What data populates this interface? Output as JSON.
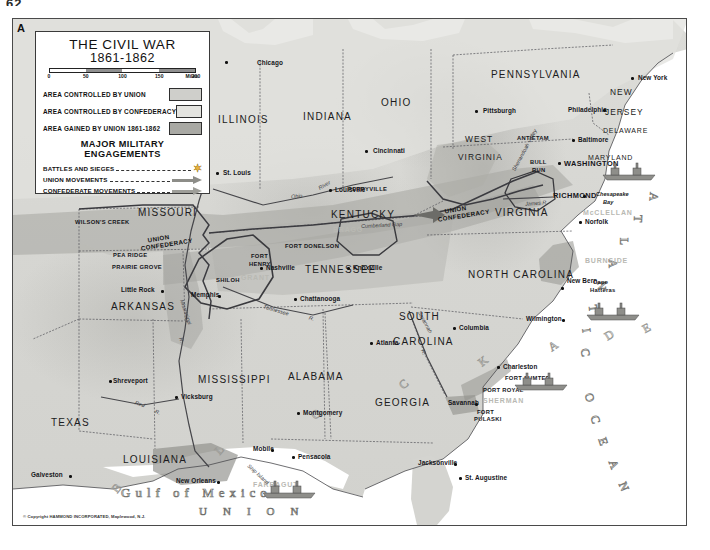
{
  "page": {
    "number": "62",
    "corner_label": "A"
  },
  "legend": {
    "title": "THE CIVIL WAR",
    "subtitle": "1861-1862",
    "scale": {
      "ticks": [
        "0",
        "50",
        "100",
        "150",
        "200"
      ],
      "unit": "Miles"
    },
    "area_rows": [
      {
        "label": "AREA CONTROLLED BY UNION",
        "swatch": "union",
        "color": "#cfcfcb"
      },
      {
        "label": "AREA CONTROLLED BY CONFEDERACY",
        "swatch": "confed",
        "color": "#e4e4e0"
      },
      {
        "label": "AREA GAINED BY UNION 1861-1862",
        "swatch": "gained",
        "color": "#a9a9a4"
      }
    ],
    "engagements_title": "MAJOR MILITARY ENGAGEMENTS",
    "engagement_rows": [
      {
        "label": "BATTLES AND SIEGES",
        "symbol": "star-icon"
      },
      {
        "label": "UNION MOVEMENTS",
        "symbol": "union-arrow-icon"
      },
      {
        "label": "CONFEDERATE MOVEMENTS",
        "symbol": "confederate-arrow-icon"
      }
    ]
  },
  "copyright": "© Copyright HAMMOND INCORPORATED, Maplewood, N.J.",
  "states": [
    {
      "name": "ILLINOIS",
      "x": 205,
      "y": 95,
      "size": "state"
    },
    {
      "name": "INDIANA",
      "x": 290,
      "y": 92,
      "size": "state"
    },
    {
      "name": "OHIO",
      "x": 368,
      "y": 78,
      "size": "state"
    },
    {
      "name": "PENNSYLVANIA",
      "x": 478,
      "y": 50,
      "size": "state"
    },
    {
      "name": "NEW",
      "x": 597,
      "y": 68,
      "size": "state sm"
    },
    {
      "name": "JERSEY",
      "x": 592,
      "y": 88,
      "size": "state sm"
    },
    {
      "name": "DELAWARE",
      "x": 590,
      "y": 108,
      "size": "state xs"
    },
    {
      "name": "MARYLAND",
      "x": 575,
      "y": 135,
      "size": "state xs"
    },
    {
      "name": "WEST",
      "x": 452,
      "y": 115,
      "size": "state sm"
    },
    {
      "name": "VIRGINIA",
      "x": 445,
      "y": 133,
      "size": "state sm"
    },
    {
      "name": "VIRGINIA",
      "x": 482,
      "y": 188,
      "size": "state"
    },
    {
      "name": "MISSOURI",
      "x": 125,
      "y": 188,
      "size": "state"
    },
    {
      "name": "KENTUCKY",
      "x": 318,
      "y": 190,
      "size": "state"
    },
    {
      "name": "TENNESSEE",
      "x": 292,
      "y": 245,
      "size": "state"
    },
    {
      "name": "NORTH CAROLINA",
      "x": 455,
      "y": 250,
      "size": "state"
    },
    {
      "name": "ARKANSAS",
      "x": 98,
      "y": 282,
      "size": "state"
    },
    {
      "name": "SOUTH",
      "x": 386,
      "y": 292,
      "size": "state"
    },
    {
      "name": "CAROLINA",
      "x": 380,
      "y": 317,
      "size": "state"
    },
    {
      "name": "MISSISSIPPI",
      "x": 185,
      "y": 355,
      "size": "state"
    },
    {
      "name": "ALABAMA",
      "x": 275,
      "y": 352,
      "size": "state"
    },
    {
      "name": "GEORGIA",
      "x": 362,
      "y": 378,
      "size": "state"
    },
    {
      "name": "TEXAS",
      "x": 38,
      "y": 398,
      "size": "state"
    },
    {
      "name": "LOUISIANA",
      "x": 110,
      "y": 435,
      "size": "state"
    }
  ],
  "cities": [
    {
      "name": "Chicago",
      "x": 244,
      "y": 40,
      "dx": 212,
      "dy": 42
    },
    {
      "name": "St. Louis",
      "x": 210,
      "y": 150,
      "dx": 203,
      "dy": 153
    },
    {
      "name": "Cincinnati",
      "x": 360,
      "y": 128,
      "dx": 352,
      "dy": 131
    },
    {
      "name": "Louisville",
      "x": 322,
      "y": 167,
      "dx": 316,
      "dy": 170
    },
    {
      "name": "Pittsburgh",
      "x": 470,
      "y": 88,
      "dx": 462,
      "dy": 91
    },
    {
      "name": "Philadelphia",
      "x": 555,
      "y": 87,
      "dx": 590,
      "dy": 90
    },
    {
      "name": "New York",
      "x": 625,
      "y": 55,
      "dx": 618,
      "dy": 58
    },
    {
      "name": "Baltimore",
      "x": 565,
      "y": 117,
      "dx": 559,
      "dy": 120
    },
    {
      "name": "WASHINGTON",
      "x": 551,
      "y": 140,
      "dx": 545,
      "dy": 143,
      "big": true
    },
    {
      "name": "RICHMOND",
      "x": 540,
      "y": 172,
      "dx": 570,
      "dy": 176,
      "big": true
    },
    {
      "name": "Norfolk",
      "x": 572,
      "y": 199,
      "dx": 566,
      "dy": 202
    },
    {
      "name": "Nashville",
      "x": 253,
      "y": 245,
      "dx": 247,
      "dy": 248
    },
    {
      "name": "Knoxville",
      "x": 340,
      "y": 245,
      "dx": 334,
      "dy": 248
    },
    {
      "name": "Memphis",
      "x": 178,
      "y": 272,
      "dx": 205,
      "dy": 276
    },
    {
      "name": "Chattanooga",
      "x": 287,
      "y": 276,
      "dx": 281,
      "dy": 279
    },
    {
      "name": "Little Rock",
      "x": 108,
      "y": 267,
      "dx": 148,
      "dy": 271
    },
    {
      "name": "New Bern",
      "x": 554,
      "y": 258,
      "dx": 548,
      "dy": 268
    },
    {
      "name": "Wilmington",
      "x": 513,
      "y": 296,
      "dx": 549,
      "dy": 300
    },
    {
      "name": "Columbia",
      "x": 446,
      "y": 305,
      "dx": 440,
      "dy": 308
    },
    {
      "name": "Charleston",
      "x": 490,
      "y": 344,
      "dx": 484,
      "dy": 347
    },
    {
      "name": "Atlanta",
      "x": 363,
      "y": 320,
      "dx": 357,
      "dy": 323
    },
    {
      "name": "Savannah",
      "x": 435,
      "y": 380,
      "dx": 462,
      "dy": 384
    },
    {
      "name": "Vicksburg",
      "x": 168,
      "y": 374,
      "dx": 162,
      "dy": 377
    },
    {
      "name": "Montgomery",
      "x": 290,
      "y": 390,
      "dx": 284,
      "dy": 393
    },
    {
      "name": "Mobile",
      "x": 240,
      "y": 426,
      "dx": 258,
      "dy": 430
    },
    {
      "name": "Pensacola",
      "x": 285,
      "y": 434,
      "dx": 279,
      "dy": 437
    },
    {
      "name": "Jacksonville",
      "x": 405,
      "y": 440,
      "dx": 441,
      "dy": 444
    },
    {
      "name": "St. Augustine",
      "x": 452,
      "y": 455,
      "dx": 446,
      "dy": 458
    },
    {
      "name": "Shreveport",
      "x": 100,
      "y": 358,
      "dx": 96,
      "dy": 361
    },
    {
      "name": "New Orleans",
      "x": 163,
      "y": 458,
      "dx": 204,
      "dy": 462
    },
    {
      "name": "Galveston",
      "x": 18,
      "y": 452,
      "dx": 56,
      "dy": 456
    }
  ],
  "battles": [
    {
      "name": "ANTIETAM",
      "x": 504,
      "y": 116
    },
    {
      "name": "BULL",
      "x": 517,
      "y": 140
    },
    {
      "name": "RUN",
      "x": 519,
      "y": 148
    },
    {
      "name": "WILSON'S CREEK",
      "x": 62,
      "y": 200
    },
    {
      "name": "PEA RIDGE",
      "x": 100,
      "y": 233
    },
    {
      "name": "PRAIRIE GROVE",
      "x": 99,
      "y": 245
    },
    {
      "name": "FORT",
      "x": 238,
      "y": 234
    },
    {
      "name": "HENRY",
      "x": 236,
      "y": 242
    },
    {
      "name": "FORT DONELSON",
      "x": 272,
      "y": 224
    },
    {
      "name": "SHILOH",
      "x": 203,
      "y": 258
    },
    {
      "name": "PERRYVILLE",
      "x": 335,
      "y": 167
    },
    {
      "name": "FORT SUMTER",
      "x": 492,
      "y": 356
    },
    {
      "name": "PORT ROYAL",
      "x": 470,
      "y": 368
    },
    {
      "name": "FORT",
      "x": 464,
      "y": 390
    },
    {
      "name": "PULASKI",
      "x": 461,
      "y": 397
    },
    {
      "name": "Cape",
      "x": 580,
      "y": 260
    },
    {
      "name": "Hatteras",
      "x": 577,
      "y": 268
    }
  ],
  "generals": [
    {
      "name": "BRAGG",
      "x": 320,
      "y": 207
    },
    {
      "name": "GRANT",
      "x": 228,
      "y": 255
    },
    {
      "name": "McCLELLAN",
      "x": 570,
      "y": 190
    },
    {
      "name": "BURNSIDE",
      "x": 572,
      "y": 238
    },
    {
      "name": "SHERMAN",
      "x": 470,
      "y": 378
    },
    {
      "name": "FARRAGUT",
      "x": 240,
      "y": 462
    }
  ],
  "boundary_labels": [
    {
      "top": "UNION",
      "bottom": "CONFEDERACY",
      "x": 135,
      "y": 214
    },
    {
      "top": "UNION",
      "bottom": "CONFEDERACY",
      "x": 432,
      "y": 185
    }
  ],
  "rivers": [
    {
      "name": "Ohio",
      "x": 278,
      "y": 174,
      "rot": -6
    },
    {
      "name": "River",
      "x": 305,
      "y": 163,
      "rot": -30
    },
    {
      "name": "Tennessee",
      "x": 250,
      "y": 288,
      "rot": 16
    },
    {
      "name": "R.",
      "x": 296,
      "y": 296,
      "rot": 16
    },
    {
      "name": "Mississippi",
      "x": 160,
      "y": 290,
      "rot": 72
    },
    {
      "name": "R.",
      "x": 166,
      "y": 318,
      "rot": 72
    },
    {
      "name": "Red",
      "x": 122,
      "y": 382,
      "rot": 18
    },
    {
      "name": "R.",
      "x": 142,
      "y": 390,
      "rot": 18
    },
    {
      "name": "Savannah",
      "x": 400,
      "y": 300,
      "rot": 62
    },
    {
      "name": "R.",
      "x": 408,
      "y": 330,
      "rot": 62
    },
    {
      "name": "James R.",
      "x": 512,
      "y": 181,
      "rot": -4
    },
    {
      "name": "Shenandoah Valley",
      "x": 488,
      "y": 128,
      "rot": -62
    },
    {
      "name": "Cumberland Gap",
      "x": 348,
      "y": 203,
      "rot": -3
    },
    {
      "name": "Ship Island",
      "x": 232,
      "y": 452,
      "rot": 42
    }
  ],
  "water_features": [
    {
      "name": "Chesapeake",
      "x": 583,
      "y": 172
    },
    {
      "name": "Bay",
      "x": 590,
      "y": 180
    }
  ],
  "ocean_text": {
    "atlantic_ocean": "ATLANTIC OCEAN",
    "blockade": "BLOCKADE",
    "gulf_of_mexico": "Gulf of Mexico",
    "union_gulf": "UNION"
  },
  "ships": [
    {
      "x": 600,
      "y": 150
    },
    {
      "x": 585,
      "y": 290
    },
    {
      "x": 518,
      "y": 360
    },
    {
      "x": 270,
      "y": 470
    }
  ]
}
